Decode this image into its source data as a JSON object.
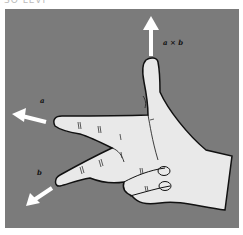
{
  "caption_cropped": "SO LEVI",
  "figure": {
    "background_color": "#7b7b7b",
    "hand_color": "#e9e9e9",
    "outline_color": "#111111",
    "arrow_color": "#ffffff",
    "labels": {
      "a": "a",
      "b": "b",
      "cross": "a × b"
    }
  }
}
